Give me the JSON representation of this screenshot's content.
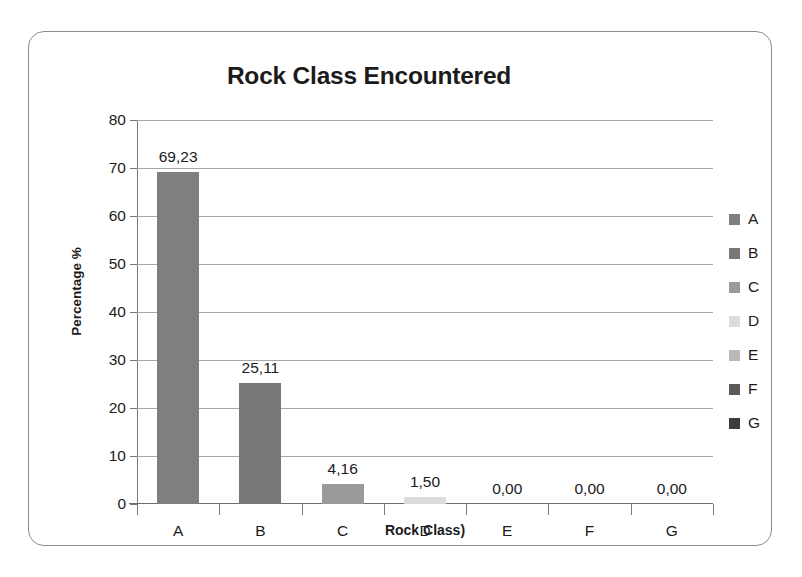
{
  "chart_data": {
    "type": "bar",
    "title": "Rock Class Encountered",
    "xlabel": "Rock Class)",
    "ylabel": "Percentage %",
    "categories": [
      "A",
      "B",
      "C",
      "D",
      "E",
      "F",
      "G"
    ],
    "values": [
      69.23,
      25.11,
      4.16,
      1.5,
      0.0,
      0.0,
      0.0
    ],
    "value_labels": [
      "69,23",
      "25,11",
      "4,16",
      "1,50",
      "0,00",
      "0,00",
      "0,00"
    ],
    "ylim": [
      0,
      80
    ],
    "y_ticks": [
      0,
      10,
      20,
      30,
      40,
      50,
      60,
      70,
      80
    ],
    "y_tick_labels": [
      "0",
      "10",
      "20",
      "30",
      "40",
      "50",
      "60",
      "70",
      "80"
    ],
    "grid": true,
    "legend_position": "right",
    "legend": [
      {
        "label": "A",
        "color": "#7f7f7f"
      },
      {
        "label": "B",
        "color": "#777777"
      },
      {
        "label": "C",
        "color": "#9a9a9a"
      },
      {
        "label": "D",
        "color": "#dcdcdc"
      },
      {
        "label": "E",
        "color": "#b9b9b9"
      },
      {
        "label": "F",
        "color": "#5a5a5a"
      },
      {
        "label": "G",
        "color": "#3c3c3c"
      }
    ],
    "bar_colors": [
      "#7f7f7f",
      "#777777",
      "#9a9a9a",
      "#dcdcdc",
      "#b9b9b9",
      "#5a5a5a",
      "#3c3c3c"
    ],
    "colors": {
      "grid": "#a8a8a8",
      "axis": "#7a7a7a",
      "text": "#1b1b1b",
      "frame": "#8d8d8d",
      "background": "#ffffff"
    }
  }
}
